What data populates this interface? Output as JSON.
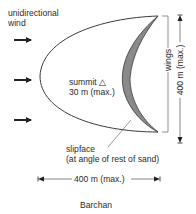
{
  "diagram": {
    "title": "Barchan",
    "wind_label_line1": "unidirectional",
    "wind_label_line2": "wind",
    "summit_label_line1": "summit",
    "summit_symbol": "△",
    "summit_label_line2": "30 m (max.)",
    "slipface_label_line1": "slipface",
    "slipface_label_line2": "(at angle of rest of sand)",
    "wings_label": "wings",
    "height_dimension": "400 m (max.)",
    "width_dimension": "400 m (max.)",
    "wind_arrow_count": 3,
    "colors": {
      "outline": "#3a3a3a",
      "slipface_fill": "#8a8a8a",
      "text": "#2b2b2b"
    }
  }
}
